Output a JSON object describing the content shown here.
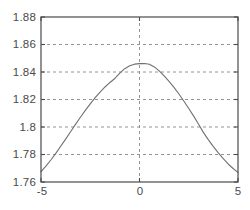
{
  "chart_data": {
    "type": "line",
    "title": "",
    "subtitle": "",
    "xlabel": "",
    "ylabel": "",
    "xlim": [
      -5,
      5
    ],
    "ylim": [
      1.76,
      1.88
    ],
    "grid": true,
    "legend": null,
    "legend_position": "none",
    "x_ticks": [
      -5,
      0,
      5
    ],
    "x_tick_labels": [
      "-5",
      "0",
      "5"
    ],
    "y_ticks": [
      1.76,
      1.78,
      1.8,
      1.82,
      1.84,
      1.86,
      1.88
    ],
    "y_tick_labels": [
      "1.76",
      "1.78",
      "1.8",
      "1.82",
      "1.84",
      "1.86",
      "1.88"
    ],
    "line_color": "#707070",
    "axis_color": "#4a4a4a",
    "grid_color": "#888888",
    "background_color": "#ffffff",
    "series": [
      {
        "name": "curve",
        "x": [
          -5,
          -4.75,
          -4.5,
          -4.25,
          -4,
          -3.75,
          -3.5,
          -3.25,
          -3,
          -2.75,
          -2.5,
          -2.25,
          -2,
          -1.75,
          -1.5,
          -1.25,
          -1,
          -0.75,
          -0.5,
          -0.25,
          0,
          0.25,
          0.5,
          0.75,
          1,
          1.25,
          1.5,
          1.75,
          2,
          2.25,
          2.5,
          2.75,
          3,
          3.25,
          3.5,
          3.75,
          4,
          4.25,
          4.5,
          4.75,
          5
        ],
        "y": [
          1.7675,
          1.7715,
          1.776,
          1.7808,
          1.786,
          1.7912,
          1.7966,
          1.8019,
          1.8071,
          1.8121,
          1.8168,
          1.8213,
          1.8254,
          1.8291,
          1.8324,
          1.8353,
          1.8392,
          1.8424,
          1.8445,
          1.8457,
          1.8461,
          1.8462,
          1.8456,
          1.8437,
          1.8408,
          1.8372,
          1.8332,
          1.8288,
          1.824,
          1.8189,
          1.8135,
          1.8079,
          1.802,
          1.7959,
          1.7906,
          1.7857,
          1.7812,
          1.777,
          1.7731,
          1.7698,
          1.767
        ]
      }
    ]
  },
  "axes": {
    "x_tick_labels": [
      "-5",
      "0",
      "5"
    ],
    "y_tick_labels": [
      "1.88",
      "1.86",
      "1.84",
      "1.82",
      "1.8",
      "1.78",
      "1.76"
    ]
  }
}
